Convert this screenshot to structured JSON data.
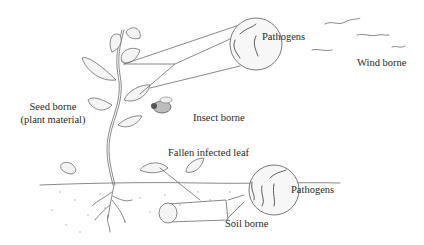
{
  "diagram": {
    "type": "pathogen-transmission-illustration",
    "labels": {
      "pathogens_top": "Pathogens",
      "wind_borne": "Wind borne",
      "seed_borne_line1": "Seed borne",
      "seed_borne_line2": "(plant material)",
      "insect_borne": "Insect borne",
      "fallen_leaf": "Fallen infected leaf",
      "pathogens_bottom": "Pathogens",
      "soil_borne": "Soil borne"
    },
    "elements": [
      {
        "id": "plant",
        "icon": "plant-icon"
      },
      {
        "id": "insect",
        "icon": "fly-icon"
      },
      {
        "id": "wind",
        "icon": "wind-lines-icon"
      },
      {
        "id": "magnifier-top",
        "icon": "magnified-pathogens-icon"
      },
      {
        "id": "magnifier-bottom",
        "icon": "magnified-pathogens-icon"
      },
      {
        "id": "soil-core",
        "icon": "soil-sample-icon"
      }
    ],
    "colors": {
      "ink": "#6b6b6b",
      "text": "#2a2a2a",
      "background": "#ffffff"
    }
  }
}
